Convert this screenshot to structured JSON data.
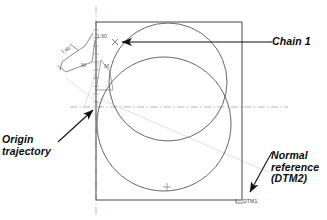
{
  "drawing": {
    "title": "Chain dimensioning with origin trajectory",
    "background_color": "#ffffff",
    "line_color": "#3c3c3c",
    "centerline_color": "#c08a8a",
    "construction_color": "#b9b9b9",
    "annotation_color": "#0a0a0a"
  },
  "callouts": {
    "chain1": "Chain 1",
    "origin_line1": "Origin",
    "origin_line2": "trajectory",
    "normal_line1": "Normal",
    "normal_line2": "reference",
    "normal_line3": "(DTM2)"
  },
  "dimensions": {
    "left_value": "1.60",
    "top_value": "1.60",
    "modifier_1": "M",
    "modifier_2": "M"
  },
  "datums": {
    "dtm1": "DTM1"
  },
  "geometry": {
    "rectangle": {
      "x": 96,
      "y": 22,
      "width": 146,
      "height": 178
    },
    "circle_upper": {
      "cx": 168,
      "cy": 82,
      "r": 59
    },
    "circle_lower": {
      "cx": 164,
      "cy": 124,
      "r": 67
    },
    "horizontal_centerline_y": 107,
    "vertical_centerline_x": 96,
    "origin_point": {
      "x": 96,
      "y": 107
    },
    "chain_point": {
      "x": 115,
      "y": 42
    },
    "center_mark": {
      "x": 167,
      "y": 187
    }
  }
}
